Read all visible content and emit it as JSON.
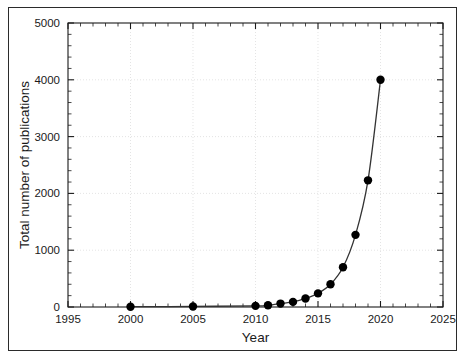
{
  "chart_data": {
    "type": "line",
    "title": "",
    "subtitle": "",
    "xlabel": "Year",
    "ylabel": "Total number of publications",
    "xlim": [
      1995,
      2025
    ],
    "ylim": [
      0,
      5000
    ],
    "xticks": [
      1995,
      2000,
      2005,
      2010,
      2015,
      2020,
      2025
    ],
    "yticks": [
      0,
      1000,
      2000,
      3000,
      4000,
      5000
    ],
    "xtick_labels": [
      "1995",
      "2000",
      "2005",
      "2010",
      "2015",
      "2020",
      "2025"
    ],
    "ytick_labels": [
      "0",
      "1000",
      "2000",
      "3000",
      "4000",
      "5000"
    ],
    "x_minor_tick_step": 1,
    "y_minor_tick_step": 200,
    "grid": true,
    "grid_style": "faint dotted gridlines at major ticks",
    "legend": null,
    "legend_position": "none",
    "marker": "filled-circle",
    "marker_color": "#000000",
    "line_color": "#333333",
    "series": [
      {
        "name": "Total number of publications",
        "x": [
          2000,
          2005,
          2010,
          2011,
          2012,
          2013,
          2014,
          2015,
          2016,
          2017,
          2018,
          2019,
          2020
        ],
        "values": [
          5,
          10,
          20,
          30,
          60,
          90,
          150,
          240,
          400,
          700,
          1270,
          2230,
          4000
        ]
      }
    ]
  },
  "figure": {
    "background_color": "#ffffff",
    "frame_color": "#2b2b2b",
    "axis_color": "#1a1a1a",
    "grid_color": "#d9d9d9"
  }
}
